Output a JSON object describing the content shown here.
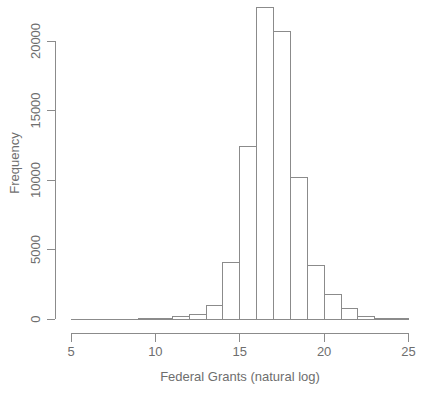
{
  "figure": {
    "background": "#ffffff",
    "line_color": "#8b8b8b",
    "text_color": "#6e6e6e",
    "bar_fill": "#ffffff",
    "bar_stroke": "#8b8b8b"
  },
  "chart_data": {
    "type": "bar",
    "subtype": "histogram",
    "title": "",
    "xlabel": "Federal Grants (natural log)",
    "ylabel": "Frequency",
    "xlim": [
      5,
      25
    ],
    "ylim": [
      0,
      22500
    ],
    "x_ticks": [
      5,
      10,
      15,
      20,
      25
    ],
    "y_ticks": [
      0,
      5000,
      10000,
      15000,
      20000
    ],
    "grid": false,
    "legend_position": "none",
    "bin_width": 1,
    "bin_edges": [
      5,
      6,
      7,
      8,
      9,
      10,
      11,
      12,
      13,
      14,
      15,
      16,
      17,
      18,
      19,
      20,
      21,
      22,
      23,
      24,
      25
    ],
    "frequencies": [
      0,
      0,
      0,
      0,
      10,
      60,
      150,
      300,
      1000,
      4100,
      12400,
      22400,
      20700,
      10200,
      3850,
      1750,
      750,
      170,
      70,
      10
    ]
  }
}
